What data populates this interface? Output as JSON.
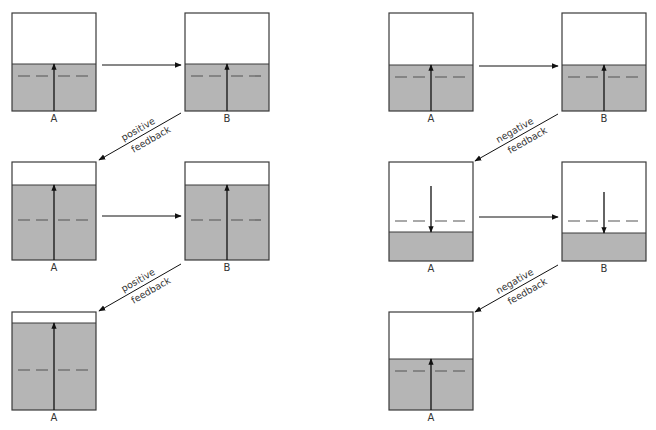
{
  "colors": {
    "fill": "#b5b5b5",
    "border": "#3a3a3a",
    "dash": "#555555",
    "arrow": "#111111",
    "background": "#ffffff"
  },
  "columns": [
    {
      "name": "positive-feedback",
      "feedback_label_line1": "positive",
      "feedback_label_line2": "feedback",
      "rows": [
        {
          "boxes": [
            {
              "label": "A",
              "x": 12,
              "y": 13,
              "w": 84,
              "h": 98,
              "fill_top": 64,
              "dash_y": 76,
              "arrow": "up",
              "arrow_from": 111,
              "arrow_to": 64
            },
            {
              "label": "B",
              "x": 185,
              "y": 13,
              "w": 84,
              "h": 98,
              "fill_top": 64,
              "dash_y": 76,
              "arrow": "up",
              "arrow_from": 111,
              "arrow_to": 64
            }
          ]
        },
        {
          "boxes": [
            {
              "label": "A",
              "x": 12,
              "y": 162,
              "w": 84,
              "h": 98,
              "fill_top": 185,
              "dash_y": 220,
              "arrow": "up",
              "arrow_from": 260,
              "arrow_to": 185
            },
            {
              "label": "B",
              "x": 185,
              "y": 162,
              "w": 84,
              "h": 98,
              "fill_top": 185,
              "dash_y": 220,
              "arrow": "up",
              "arrow_from": 260,
              "arrow_to": 185
            }
          ]
        },
        {
          "boxes": [
            {
              "label": "A",
              "x": 12,
              "y": 312,
              "w": 84,
              "h": 98,
              "fill_top": 323,
              "dash_y": 370,
              "arrow": "up",
              "arrow_from": 410,
              "arrow_to": 323
            }
          ]
        }
      ]
    },
    {
      "name": "negative-feedback",
      "feedback_label_line1": "negative",
      "feedback_label_line2": "feedback",
      "rows": [
        {
          "boxes": [
            {
              "label": "A",
              "x": 389,
              "y": 13,
              "w": 84,
              "h": 98,
              "fill_top": 65,
              "dash_y": 77,
              "arrow": "up",
              "arrow_from": 111,
              "arrow_to": 65
            },
            {
              "label": "B",
              "x": 562,
              "y": 13,
              "w": 84,
              "h": 98,
              "fill_top": 65,
              "dash_y": 77,
              "arrow": "up",
              "arrow_from": 111,
              "arrow_to": 65
            }
          ]
        },
        {
          "boxes": [
            {
              "label": "A",
              "x": 389,
              "y": 162,
              "w": 84,
              "h": 99,
              "fill_top": 232,
              "dash_y": 221,
              "arrow": "down",
              "arrow_from": 186,
              "arrow_to": 232
            },
            {
              "label": "B",
              "x": 562,
              "y": 162,
              "w": 84,
              "h": 99,
              "fill_top": 233,
              "dash_y": 221,
              "arrow": "down",
              "arrow_from": 192,
              "arrow_to": 233
            }
          ]
        },
        {
          "boxes": [
            {
              "label": "A",
              "x": 389,
              "y": 312,
              "w": 84,
              "h": 98,
              "fill_top": 359,
              "dash_y": 371,
              "arrow": "up",
              "arrow_from": 410,
              "arrow_to": 359
            }
          ]
        }
      ]
    }
  ],
  "horizontal_arrows": [
    {
      "x1": 102,
      "x2": 181,
      "y": 65
    },
    {
      "x1": 102,
      "x2": 181,
      "y": 216
    },
    {
      "x1": 479,
      "x2": 558,
      "y": 66
    },
    {
      "x1": 479,
      "x2": 558,
      "y": 217
    }
  ],
  "diagonal_arrows": [
    {
      "col": 0,
      "x1": 181,
      "y1": 113,
      "x2": 99,
      "y2": 160
    },
    {
      "col": 0,
      "x1": 181,
      "y1": 264,
      "x2": 99,
      "y2": 311
    },
    {
      "col": 1,
      "x1": 558,
      "y1": 114,
      "x2": 475,
      "y2": 161
    },
    {
      "col": 1,
      "x1": 558,
      "y1": 265,
      "x2": 475,
      "y2": 312
    }
  ]
}
